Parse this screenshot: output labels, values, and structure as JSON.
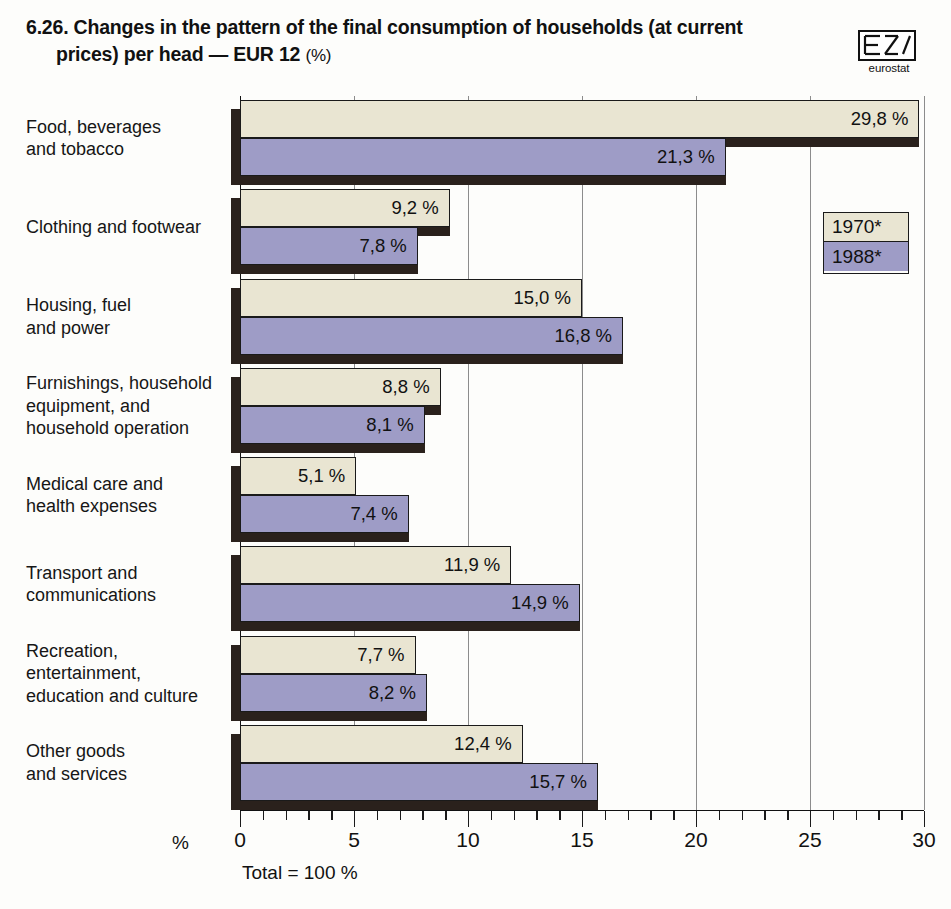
{
  "header": {
    "number": "6.26.",
    "title_line1": "Changes in the pattern of the final consumption of households (at current",
    "title_line2": "prices) per head — EUR 12",
    "title_unit": "(%)",
    "logo_word": "eurostat",
    "logo_icon": "eurostat-logo"
  },
  "legend": {
    "items": [
      {
        "label": "1970*",
        "color": "#e9e5d2"
      },
      {
        "label": "1988*",
        "color": "#9e9cc6"
      }
    ]
  },
  "axis": {
    "unit_label": "%",
    "total_note": "Total = 100 %",
    "tick_labels": [
      "0",
      "5",
      "10",
      "15",
      "20",
      "25",
      "30"
    ]
  },
  "chart_data": {
    "type": "bar",
    "orientation": "horizontal",
    "title": "6.26. Changes in the pattern of the final consumption of households (at current prices) per head — EUR 12 (%)",
    "xlabel": "%",
    "ylabel": "",
    "xlim": [
      0,
      30
    ],
    "xticks": [
      0,
      5,
      10,
      15,
      20,
      25,
      30
    ],
    "minor_tick_step": 1,
    "grid": true,
    "legend_position": "right",
    "note": "Total = 100 %",
    "categories": [
      "Food, beverages and tobacco",
      "Clothing and footwear",
      "Housing, fuel and power",
      "Furnishings, household equipment, and household operation",
      "Medical care and health expenses",
      "Transport and communications",
      "Recreation, entertainment, education and culture",
      "Other goods and services"
    ],
    "category_lines": [
      [
        "Food, beverages",
        "and tobacco"
      ],
      [
        "Clothing and footwear"
      ],
      [
        "Housing, fuel",
        "and power"
      ],
      [
        "Furnishings, household",
        "equipment, and",
        "household operation"
      ],
      [
        "Medical care and",
        "health expenses"
      ],
      [
        "Transport and",
        "communications"
      ],
      [
        "Recreation,",
        "entertainment,",
        "education and culture"
      ],
      [
        "Other goods",
        "and services"
      ]
    ],
    "series": [
      {
        "name": "1970*",
        "color": "#e9e5d2",
        "values": [
          29.8,
          9.2,
          15.0,
          8.8,
          5.1,
          11.9,
          7.7,
          12.4
        ],
        "labels": [
          "29,8 %",
          "9,2 %",
          "15,0 %",
          "8,8 %",
          "5,1 %",
          "11,9 %",
          "7,7 %",
          "12,4 %"
        ]
      },
      {
        "name": "1988*",
        "color": "#9e9cc6",
        "values": [
          21.3,
          7.8,
          16.8,
          8.1,
          7.4,
          14.9,
          8.2,
          15.7
        ],
        "labels": [
          "21,3 %",
          "7,8 %",
          "16,8 %",
          "8,1 %",
          "7,4 %",
          "14,9 %",
          "8,2 %",
          "15,7 %"
        ]
      }
    ]
  }
}
